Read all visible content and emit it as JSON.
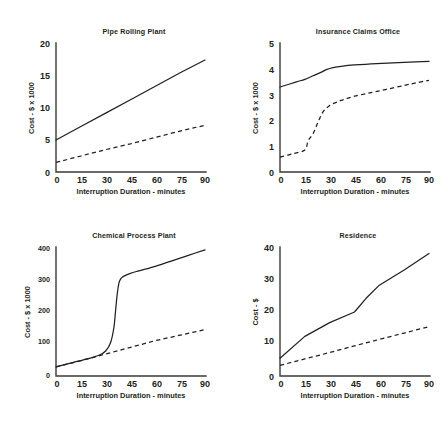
{
  "figure": {
    "panel_count": 4,
    "shared_xlabel": "Interruption Duration - minutes",
    "shared_xticks": [
      "0",
      "15",
      "30",
      "45",
      "60",
      "75",
      "90"
    ]
  },
  "chart_data": [
    {
      "id": "pipe-rolling-plant",
      "type": "line",
      "title": "Pipe Rolling Plant",
      "xlabel": "Interruption Duration - minutes",
      "ylabel": "Cost - $ x 1000",
      "xlim": [
        0,
        90
      ],
      "ylim": [
        0,
        20
      ],
      "xticks": [
        0,
        15,
        30,
        45,
        60,
        75,
        90
      ],
      "yticks": [
        0,
        5,
        10,
        15,
        20
      ],
      "xtick_labels": [
        "0",
        "15",
        "30",
        "45",
        "60",
        "75",
        "90"
      ],
      "ytick_labels": [
        "0",
        "5",
        "10",
        "15",
        "20"
      ],
      "grid": false,
      "legend": "none",
      "series": [
        {
          "name": "solid",
          "style": "solid",
          "x": [
            0,
            15,
            30,
            45,
            60,
            75,
            90
          ],
          "values": [
            5.0,
            7.1,
            9.2,
            11.3,
            13.4,
            15.5,
            17.5
          ]
        },
        {
          "name": "dashed",
          "style": "dashed",
          "x": [
            0,
            15,
            30,
            45,
            60,
            75,
            90
          ],
          "values": [
            1.5,
            2.5,
            3.5,
            4.4,
            5.4,
            6.4,
            7.3
          ]
        }
      ]
    },
    {
      "id": "insurance-claims-office",
      "type": "line",
      "title": "Insurance Claims Office",
      "xlabel": "Interruption Duration - minutes",
      "ylabel": "Cost - $ x 1000",
      "xlim": [
        0,
        90
      ],
      "ylim": [
        0,
        5
      ],
      "xticks": [
        0,
        15,
        30,
        45,
        60,
        75,
        90
      ],
      "yticks": [
        0,
        1,
        2,
        3,
        4,
        5
      ],
      "xtick_labels": [
        "0",
        "15",
        "30",
        "45",
        "60",
        "75",
        "90"
      ],
      "ytick_labels": [
        "0",
        "1",
        "2",
        "3",
        "4",
        "5"
      ],
      "grid": false,
      "legend": "none",
      "series": [
        {
          "name": "solid",
          "style": "solid",
          "x": [
            0,
            10,
            15,
            20,
            25,
            28,
            32,
            38,
            45,
            55,
            65,
            75,
            90
          ],
          "values": [
            3.32,
            3.52,
            3.62,
            3.76,
            3.9,
            4.0,
            4.08,
            4.14,
            4.18,
            4.22,
            4.25,
            4.28,
            4.32
          ]
        },
        {
          "name": "dashed",
          "style": "dashed",
          "x": [
            0,
            8,
            15,
            17,
            20,
            23,
            26,
            30,
            34,
            38,
            45,
            55,
            65,
            75,
            82,
            90
          ],
          "values": [
            0.58,
            0.72,
            0.86,
            1.22,
            1.5,
            1.95,
            2.35,
            2.6,
            2.72,
            2.82,
            2.96,
            3.1,
            3.24,
            3.38,
            3.48,
            3.58
          ]
        }
      ]
    },
    {
      "id": "chemical-process-plant",
      "type": "line",
      "title": "Chemical Process Plant",
      "xlabel": "Interruption Duration - minutes",
      "ylabel": "Cost - $ x 1000",
      "xlim": [
        0,
        90
      ],
      "ylim": [
        0,
        420
      ],
      "xticks": [
        0,
        15,
        30,
        45,
        60,
        75,
        90
      ],
      "yticks": [
        0,
        100,
        200,
        300,
        400
      ],
      "xtick_labels": [
        "0",
        "100",
        "200",
        "300",
        "400"
      ],
      "ytick_labels": [
        "0",
        "100",
        "200",
        "300",
        "400"
      ],
      "grid": false,
      "legend": "none",
      "series": [
        {
          "name": "solid",
          "style": "solid",
          "x": [
            0,
            10,
            20,
            26,
            30,
            33,
            35,
            36,
            37,
            38,
            39,
            40,
            42,
            45,
            50,
            60,
            70,
            80,
            90
          ],
          "values": [
            30,
            44,
            58,
            68,
            82,
            110,
            160,
            215,
            270,
            305,
            318,
            324,
            330,
            337,
            345,
            360,
            378,
            396,
            414
          ]
        },
        {
          "name": "dashed",
          "style": "dashed",
          "x": [
            0,
            15,
            30,
            45,
            60,
            75,
            90
          ],
          "values": [
            30,
            50,
            72,
            94,
            116,
            134,
            152
          ]
        }
      ]
    },
    {
      "id": "residence",
      "type": "line",
      "title": "Residence",
      "xlabel": "Interruption Duration - minutes",
      "ylabel": "Cost - $",
      "xlim": [
        0,
        90
      ],
      "ylim": [
        0,
        42
      ],
      "xticks": [
        0,
        15,
        30,
        45,
        60,
        75,
        90
      ],
      "yticks": [
        0,
        10,
        20,
        30,
        40
      ],
      "xtick_labels": [
        "0",
        "15",
        "30",
        "45",
        "60",
        "75",
        "90"
      ],
      "ytick_labels": [
        "0",
        "10",
        "20",
        "30",
        "40"
      ],
      "grid": false,
      "legend": "none",
      "series": [
        {
          "name": "solid",
          "style": "solid",
          "x": [
            0,
            15,
            30,
            45,
            52,
            60,
            75,
            90
          ],
          "values": [
            5.8,
            13.0,
            17.5,
            21.0,
            25.5,
            29.8,
            34.8,
            40.2
          ]
        },
        {
          "name": "dashed",
          "style": "dashed",
          "x": [
            0,
            15,
            30,
            45,
            60,
            75,
            90
          ],
          "values": [
            3.5,
            5.6,
            7.7,
            9.9,
            12.0,
            14.1,
            16.2
          ]
        }
      ]
    }
  ]
}
